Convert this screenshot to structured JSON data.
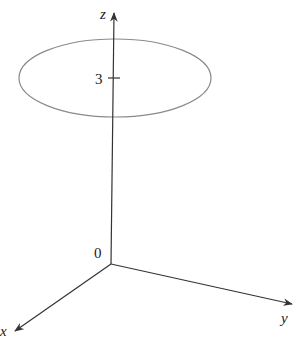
{
  "diagram": {
    "type": "3d-coordinate-axes",
    "axes": {
      "x": {
        "label": "x"
      },
      "y": {
        "label": "y"
      },
      "z": {
        "label": "z"
      }
    },
    "origin_label": "0",
    "tick": {
      "label": "3",
      "axis": "z"
    },
    "shape": {
      "kind": "circle",
      "plane": "z = 3",
      "rendered_as": "ellipse"
    },
    "colors": {
      "axes": "#333333",
      "circle": "#8a8a8a",
      "text": "#222222",
      "background": "#ffffff"
    }
  }
}
